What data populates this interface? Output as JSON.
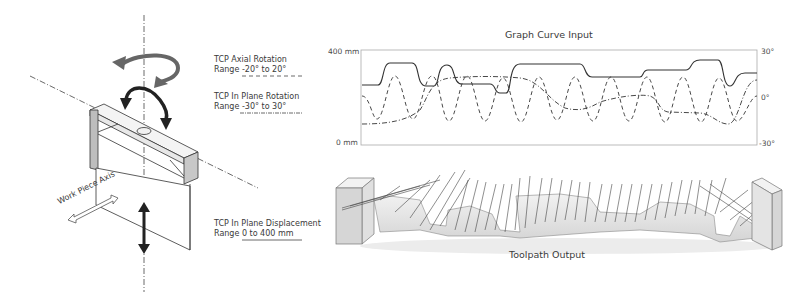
{
  "left_diagram": {
    "axial_rotation": {
      "title": "TCP Axial Rotation",
      "range": "Range -20° to 20°",
      "line_style": "dashed"
    },
    "in_plane_rotation": {
      "title": "TCP In Plane Rotation",
      "range": "Range -30° to 30°",
      "line_style": "dash-dot"
    },
    "in_plane_displacement": {
      "title": "TCP In Plane Displacement",
      "range": "Range 0 to 400 mm",
      "line_style": "solid"
    },
    "work_piece_axis": "Work Piece Axis"
  },
  "graph": {
    "title": "Graph Curve Input",
    "left_axis": {
      "top": "400 mm",
      "bottom": "0 mm"
    },
    "right_axis": {
      "top": "30°",
      "middle": "0°",
      "bottom": "-30°"
    }
  },
  "toolpath": {
    "title": "Toolpath Output"
  },
  "colors": {
    "line": "#333333",
    "frame": "#aaaaaa",
    "block_fill": "#d9d9d9",
    "body_fill": "#e6e6e6"
  }
}
